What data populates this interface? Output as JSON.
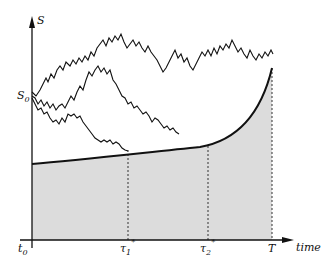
{
  "figure": {
    "y_axis_label": "S",
    "x_axis_label": "time",
    "initial_value_label": "S",
    "initial_value_subscript": "0",
    "origin_label": "t",
    "origin_subscript": "0",
    "stopping_time_1_label": "τ",
    "stopping_time_1_subscript": "1",
    "stopping_time_1_superscript": "*",
    "stopping_time_2_label": "τ",
    "stopping_time_2_subscript": "2",
    "stopping_time_2_superscript": "*",
    "terminal_time_label": "T",
    "colors": {
      "ink": "#111111",
      "shaded_region": "#dcdcdc",
      "background": "#ffffff"
    }
  }
}
